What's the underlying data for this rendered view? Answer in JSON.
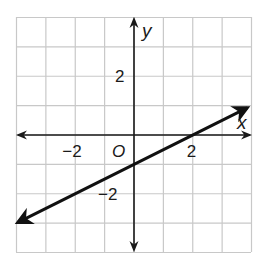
{
  "chart_data": {
    "type": "line",
    "title": "",
    "xlabel": "x",
    "ylabel": "y",
    "origin_label": "O",
    "xlim": [
      -4,
      4
    ],
    "ylim": [
      -4,
      4
    ],
    "grid": true,
    "grid_step": 1,
    "x_ticks": [
      {
        "value": -2,
        "label": "−2"
      },
      {
        "value": 2,
        "label": "2"
      }
    ],
    "y_ticks": [
      {
        "value": 2,
        "label": "2"
      },
      {
        "value": -2,
        "label": "−2"
      }
    ],
    "series": [
      {
        "name": "line",
        "equation": "y = 0.5x - 1",
        "slope": 0.5,
        "y_intercept": -1,
        "x_intercept": 2,
        "x": [
          -4,
          4
        ],
        "y": [
          -3,
          1
        ],
        "arrows_both_ends": true
      }
    ],
    "legend": null
  },
  "colors": {
    "grid": "#c8c8c8",
    "axis": "#1a1a1a",
    "line": "#111111"
  }
}
